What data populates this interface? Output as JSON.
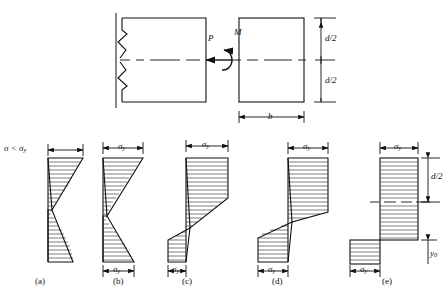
{
  "figure": {
    "type": "engineering-stress-distribution-diagram",
    "line_color": "#111111",
    "background": "#ffffff"
  },
  "top_diagram": {
    "load_label": "P",
    "moment_label": "M",
    "depth_upper_label": "d/2",
    "depth_lower_label": "d/2",
    "width_label": "b",
    "beam_has_break_marks": true,
    "centerline_style": "dash-dot"
  },
  "panels": [
    {
      "id": "a",
      "caption": "(a)",
      "top_label": "σ < σ",
      "top_label_sub": "y",
      "bottom_label": "",
      "bottom_label_sub": "",
      "state": "fully elastic",
      "shape": "linear-bilinear triangles crossing zero"
    },
    {
      "id": "b",
      "caption": "(b)",
      "top_label": "σ",
      "top_label_sub": "y",
      "bottom_label": "σ",
      "bottom_label_sub": "y",
      "state": "first yield at extreme fibres",
      "shape": "linear triangles reaching yield stress"
    },
    {
      "id": "c",
      "caption": "(c)",
      "top_label": "σ",
      "top_label_sub": "y",
      "bottom_label": "σ",
      "bottom_label_sub": "y",
      "state": "partial yielding",
      "shape": "plastic plateau plus elastic core"
    },
    {
      "id": "d",
      "caption": "(d)",
      "top_label": "σ",
      "top_label_sub": "y",
      "bottom_label": "σ",
      "bottom_label_sub": "y",
      "state": "advanced yielding",
      "shape": "large plastic zones with narrow elastic core"
    },
    {
      "id": "e",
      "caption": "(e)",
      "top_label": "σ",
      "top_label_sub": "y",
      "bottom_label": "σ",
      "bottom_label_sub": "y",
      "state": "fully plastic",
      "shape": "rectangular stress blocks",
      "depth_label": "d/2",
      "neutral_axis_offset_label": "y",
      "neutral_axis_offset_sub": "0"
    }
  ]
}
